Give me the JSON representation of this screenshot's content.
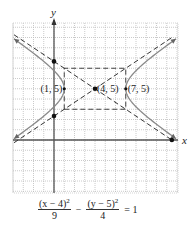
{
  "chart_data": {
    "type": "line",
    "title": "",
    "xlabel": "x",
    "ylabel": "y",
    "xlim": [
      -4,
      12
    ],
    "ylim": [
      -5,
      11.5
    ],
    "grid": true,
    "hyperbola": {
      "h": 4,
      "k": 5,
      "a": 3,
      "b": 2,
      "orientation": "horizontal"
    },
    "series": [
      {
        "name": "hyperbola",
        "style": "solid",
        "color": "#8a8a8a"
      },
      {
        "name": "asymptotes",
        "style": "dashed",
        "color": "#333333"
      },
      {
        "name": "fundamental-rectangle",
        "style": "dashed",
        "color": "#333333",
        "corners": [
          [
            1,
            3
          ],
          [
            7,
            3
          ],
          [
            7,
            7
          ],
          [
            1,
            7
          ]
        ]
      }
    ],
    "points": [
      {
        "x": 1,
        "y": 5,
        "label": "(1, 5)",
        "label_side": "left"
      },
      {
        "x": 4,
        "y": 5,
        "label": "(4, 5)",
        "label_side": "right"
      },
      {
        "x": 7,
        "y": 5,
        "label": "(7, 5)",
        "label_side": "right"
      },
      {
        "x": 0,
        "y": 7.67,
        "label": ""
      },
      {
        "x": 0,
        "y": 2.33,
        "label": ""
      },
      {
        "x": 11.5,
        "y": 0,
        "label": ""
      }
    ],
    "equation": {
      "term1_num": "(x − 4)",
      "term1_exp": "2",
      "term1_den": "9",
      "operator": "−",
      "term2_num": "(y − 5)",
      "term2_exp": "2",
      "term2_den": "4",
      "rhs": "= 1"
    }
  }
}
